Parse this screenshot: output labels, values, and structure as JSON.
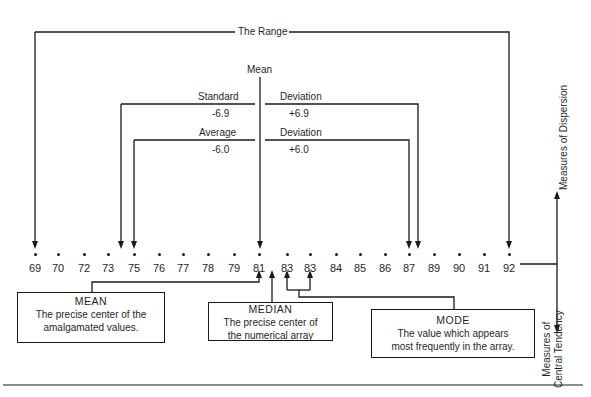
{
  "diagram": {
    "range_label": "The Range",
    "mean_label": "Mean",
    "standard_deviation": {
      "left_label": "Standard",
      "right_label": "Deviation",
      "minus_value": "-6.9",
      "plus_value": "+6.9"
    },
    "average_deviation": {
      "left_label": "Average",
      "right_label": "Deviation",
      "minus_value": "-6.0",
      "plus_value": "+6.0"
    },
    "values": [
      "69",
      "70",
      "72",
      "73",
      "75",
      "76",
      "77",
      "78",
      "79",
      "81",
      "83",
      "83",
      "84",
      "85",
      "86",
      "87",
      "89",
      "90",
      "91",
      "92"
    ],
    "boxes": {
      "mean": {
        "title": "MEAN",
        "line1": "The precise center of the",
        "line2": "amalgamated values."
      },
      "median": {
        "title": "MEDIAN",
        "line1": "The precise center of",
        "line2": "the numerical array"
      },
      "mode": {
        "title": "MODE",
        "line1": "The value which appears",
        "line2": "most frequently in the array."
      }
    },
    "axis_labels": {
      "dispersion": "Measures of Dispersion",
      "central_tendency_line1": "Measures of",
      "central_tendency_line2": "Central Tendency"
    }
  }
}
